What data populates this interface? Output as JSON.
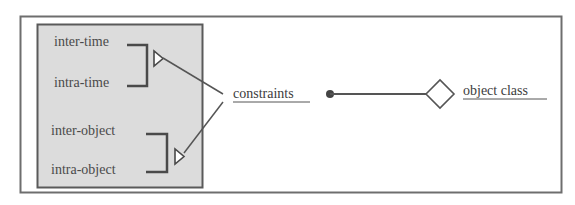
{
  "diagram": {
    "group": {
      "time_pair": [
        "inter-time",
        "intra-time"
      ],
      "object_pair": [
        "inter-object",
        "intra-object"
      ]
    },
    "constraints_label": "constraints",
    "object_class_label": "object class",
    "colors": {
      "frame": "#6e6e6e",
      "group_fill": "#dcdcdc",
      "group_border": "#5a5a5a",
      "line": "#555555",
      "text": "#4a4a4a"
    }
  }
}
